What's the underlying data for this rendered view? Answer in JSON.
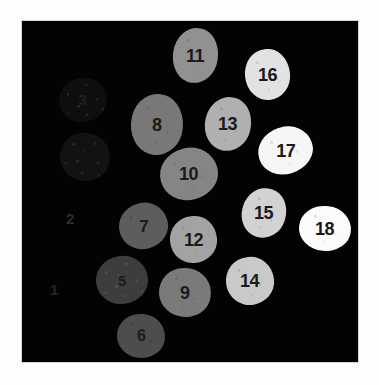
{
  "figure": {
    "background_color": "#fdfdfd",
    "canvas_color": "#030303",
    "canvas": {
      "x": 22,
      "y": 21,
      "width": 336,
      "height": 341
    }
  },
  "objects": [
    {
      "id": "blob-1-label",
      "label": "1",
      "kind": "label_only",
      "x": 50,
      "y": 282,
      "w": 14,
      "h": 18,
      "color": "#262626",
      "font_size": 15
    },
    {
      "id": "blob-2-label",
      "label": "2",
      "kind": "label_only",
      "x": 66,
      "y": 211,
      "w": 14,
      "h": 18,
      "color": "#2c2c2c",
      "font_size": 15
    },
    {
      "id": "blob-3",
      "label": "3",
      "kind": "blob",
      "x": 59,
      "y": 78,
      "w": 48,
      "h": 44,
      "color": "#0e0e0e",
      "label_color": "#202020",
      "font_size": 14,
      "texture": "textured",
      "rot": -12
    },
    {
      "id": "blob-4",
      "label": "",
      "kind": "blob",
      "x": 60,
      "y": 133,
      "w": 50,
      "h": 48,
      "color": "#121212",
      "label_color": "#1e1e1e",
      "font_size": 14,
      "texture": "textured",
      "rot": 14
    },
    {
      "id": "blob-5",
      "label": "5",
      "kind": "blob",
      "x": 96,
      "y": 256,
      "w": 52,
      "h": 48,
      "color": "#3d3d3d",
      "label_color": "#1c1c1c",
      "font_size": 15,
      "texture": "textured",
      "rot": -8
    },
    {
      "id": "blob-6",
      "label": "6",
      "kind": "blob",
      "x": 117,
      "y": 314,
      "w": 48,
      "h": 44,
      "color": "#4d4d4d",
      "label_color": "#1b1b1b",
      "font_size": 16,
      "texture": "speckled",
      "rot": 6
    },
    {
      "id": "blob-7",
      "label": "7",
      "kind": "blob",
      "x": 119,
      "y": 203,
      "w": 49,
      "h": 46,
      "color": "#5d5d5d",
      "label_color": "#1a1a1a",
      "font_size": 17,
      "texture": "speckled",
      "rot": -16
    },
    {
      "id": "blob-8",
      "label": "8",
      "kind": "blob",
      "x": 131,
      "y": 94,
      "w": 52,
      "h": 61,
      "color": "#787878",
      "label_color": "#1a1a1a",
      "font_size": 18,
      "texture": "speckled",
      "rot": 4
    },
    {
      "id": "blob-9",
      "label": "9",
      "kind": "blob",
      "x": 159,
      "y": 268,
      "w": 52,
      "h": 49,
      "color": "#7a7a7a",
      "label_color": "#1a1a1a",
      "font_size": 18,
      "texture": "speckled",
      "rot": 9
    },
    {
      "id": "blob-10",
      "label": "10",
      "kind": "blob",
      "x": 160,
      "y": 148,
      "w": 58,
      "h": 52,
      "color": "#858585",
      "label_color": "#1a1a1a",
      "font_size": 18,
      "texture": "speckled",
      "rot": -14
    },
    {
      "id": "blob-11",
      "label": "11",
      "kind": "blob",
      "x": 173,
      "y": 28,
      "w": 45,
      "h": 55,
      "color": "#919191",
      "label_color": "#1a1a1a",
      "font_size": 18,
      "texture": "speckled",
      "rot": 8
    },
    {
      "id": "blob-12",
      "label": "12",
      "kind": "blob",
      "x": 170,
      "y": 216,
      "w": 47,
      "h": 47,
      "color": "#a3a3a3",
      "label_color": "#1a1a1a",
      "font_size": 18,
      "texture": "speckled",
      "rot": -5
    },
    {
      "id": "blob-13",
      "label": "13",
      "kind": "blob",
      "x": 205,
      "y": 97,
      "w": 46,
      "h": 54,
      "color": "#b0b0b0",
      "label_color": "#1a1a1a",
      "font_size": 18,
      "texture": "speckled",
      "rot": 11
    },
    {
      "id": "blob-14",
      "label": "14",
      "kind": "blob",
      "x": 226,
      "y": 257,
      "w": 48,
      "h": 48,
      "color": "#c9c9c9",
      "label_color": "#1a1a1a",
      "font_size": 18,
      "texture": "speckled",
      "rot": -7
    },
    {
      "id": "blob-15",
      "label": "15",
      "kind": "blob",
      "x": 242,
      "y": 188,
      "w": 44,
      "h": 50,
      "color": "#d2d2d2",
      "label_color": "#1a1a1a",
      "font_size": 18,
      "texture": "speckled",
      "rot": 17
    },
    {
      "id": "blob-16",
      "label": "16",
      "kind": "blob",
      "x": 245,
      "y": 49,
      "w": 45,
      "h": 51,
      "color": "#e2e2e2",
      "label_color": "#1a1a1a",
      "font_size": 18,
      "texture": "speckled",
      "rot": -6
    },
    {
      "id": "blob-17",
      "label": "17",
      "kind": "blob",
      "x": 258,
      "y": 127,
      "w": 55,
      "h": 47,
      "color": "#f6f6f6",
      "label_color": "#1a1a1a",
      "font_size": 18,
      "texture": "speckled",
      "rot": -18
    },
    {
      "id": "blob-18",
      "label": "18",
      "kind": "blob",
      "x": 299,
      "y": 206,
      "w": 52,
      "h": 45,
      "color": "#fbfbfb",
      "label_color": "#1a1a1a",
      "font_size": 18,
      "texture": "speckled",
      "rot": 5
    }
  ]
}
